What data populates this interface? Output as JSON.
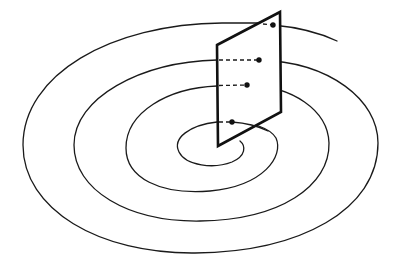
{
  "diagram": {
    "type": "poincare-section",
    "colors": {
      "line": "#1a1a1a",
      "plane": "#111111",
      "background": "#ffffff"
    },
    "plane": {
      "corners": [
        [
          217,
          45
        ],
        [
          280,
          12
        ],
        [
          281,
          112
        ],
        [
          218,
          146
        ]
      ]
    },
    "intersections": [
      {
        "id": "p1",
        "x": 273,
        "y": 25
      },
      {
        "id": "p2",
        "x": 259,
        "y": 60
      },
      {
        "id": "p3",
        "x": 247,
        "y": 85
      },
      {
        "id": "p4",
        "x": 232,
        "y": 122
      }
    ],
    "labels": []
  }
}
